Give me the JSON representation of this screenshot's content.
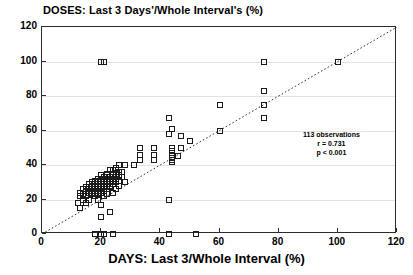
{
  "chart_data": {
    "type": "scatter",
    "title": "DOSES: Last 3 Days'/Whole Interval's (%)",
    "xlabel": "DAYS:  Last 3/Whole Interval (%)",
    "ylabel": "",
    "xlim": [
      0,
      120
    ],
    "ylim": [
      0,
      120
    ],
    "xticks": [
      0,
      20,
      40,
      60,
      80,
      100,
      120
    ],
    "yticks": [
      0,
      20,
      40,
      60,
      80,
      100,
      120
    ],
    "grid": "horizontal",
    "legend": "none",
    "marker": "open-square",
    "reference_line": {
      "type": "identity",
      "style": "dotted",
      "from": [
        0,
        0
      ],
      "to": [
        120,
        120
      ]
    },
    "annotations": {
      "observations": "113 observations",
      "r": "r = 0.731",
      "p": "p < 0.001"
    },
    "points": [
      [
        20,
        100
      ],
      [
        21,
        100
      ],
      [
        75,
        100
      ],
      [
        100,
        100
      ],
      [
        75,
        83
      ],
      [
        60,
        75
      ],
      [
        43,
        67
      ],
      [
        75,
        75
      ],
      [
        75,
        67
      ],
      [
        44,
        61
      ],
      [
        60,
        60
      ],
      [
        43,
        58
      ],
      [
        47,
        57
      ],
      [
        50,
        54
      ],
      [
        33,
        50
      ],
      [
        38,
        50
      ],
      [
        44,
        50
      ],
      [
        47,
        50
      ],
      [
        44,
        48
      ],
      [
        33,
        46
      ],
      [
        38,
        46
      ],
      [
        44,
        46
      ],
      [
        46,
        45
      ],
      [
        44,
        44
      ],
      [
        33,
        43
      ],
      [
        38,
        43
      ],
      [
        44,
        43
      ],
      [
        44,
        42
      ],
      [
        31,
        40
      ],
      [
        26,
        40
      ],
      [
        28,
        40
      ],
      [
        25,
        38
      ],
      [
        24,
        37
      ],
      [
        23,
        37
      ],
      [
        26,
        36
      ],
      [
        27,
        36
      ],
      [
        22,
        35
      ],
      [
        24,
        35
      ],
      [
        25,
        35
      ],
      [
        20,
        34
      ],
      [
        22,
        34
      ],
      [
        24,
        34
      ],
      [
        26,
        34
      ],
      [
        21,
        33
      ],
      [
        23,
        33
      ],
      [
        25,
        33
      ],
      [
        27,
        33
      ],
      [
        19,
        32
      ],
      [
        21,
        32
      ],
      [
        23,
        32
      ],
      [
        25,
        32
      ],
      [
        18,
        31
      ],
      [
        20,
        31
      ],
      [
        22,
        31
      ],
      [
        24,
        31
      ],
      [
        26,
        31
      ],
      [
        17,
        30
      ],
      [
        19,
        30
      ],
      [
        21,
        30
      ],
      [
        23,
        30
      ],
      [
        25,
        30
      ],
      [
        28,
        30
      ],
      [
        16,
        29
      ],
      [
        18,
        29
      ],
      [
        20,
        29
      ],
      [
        22,
        29
      ],
      [
        24,
        29
      ],
      [
        17,
        28
      ],
      [
        19,
        28
      ],
      [
        21,
        28
      ],
      [
        23,
        28
      ],
      [
        26,
        28
      ],
      [
        15,
        27
      ],
      [
        17,
        27
      ],
      [
        19,
        27
      ],
      [
        21,
        27
      ],
      [
        23,
        27
      ],
      [
        14,
        26
      ],
      [
        16,
        26
      ],
      [
        18,
        26
      ],
      [
        20,
        26
      ],
      [
        22,
        26
      ],
      [
        25,
        26
      ],
      [
        15,
        25
      ],
      [
        17,
        25
      ],
      [
        19,
        25
      ],
      [
        21,
        25
      ],
      [
        13,
        24
      ],
      [
        16,
        24
      ],
      [
        18,
        24
      ],
      [
        20,
        24
      ],
      [
        24,
        24
      ],
      [
        14,
        23
      ],
      [
        17,
        23
      ],
      [
        19,
        23
      ],
      [
        22,
        23
      ],
      [
        13,
        22
      ],
      [
        15,
        22
      ],
      [
        18,
        22
      ],
      [
        21,
        22
      ],
      [
        14,
        20
      ],
      [
        16,
        20
      ],
      [
        19,
        20
      ],
      [
        43,
        20
      ],
      [
        12,
        18
      ],
      [
        15,
        18
      ],
      [
        20,
        17
      ],
      [
        13,
        15
      ],
      [
        23,
        13
      ],
      [
        20,
        10
      ],
      [
        18,
        0
      ],
      [
        20,
        0
      ],
      [
        21,
        0
      ],
      [
        24,
        0
      ],
      [
        43,
        0
      ],
      [
        52,
        0
      ]
    ]
  }
}
